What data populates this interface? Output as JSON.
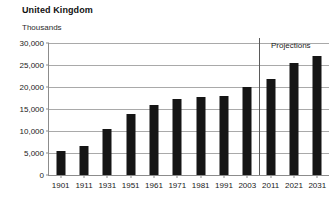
{
  "chart_data": {
    "type": "bar",
    "title": "United Kingdom",
    "subtitle": "Thousands",
    "xlabel": "",
    "ylabel": "Thousands",
    "ylim": [
      0,
      30000
    ],
    "ytick_labels": [
      "30,000",
      "25,000",
      "20,000",
      "15,000",
      "10,000",
      "5,000",
      "0"
    ],
    "ytick_values": [
      30000,
      25000,
      20000,
      15000,
      10000,
      5000,
      0
    ],
    "grid": true,
    "legend": "none",
    "categories": [
      "1901",
      "1911",
      "1931",
      "1951",
      "1961",
      "1971",
      "1981",
      "1991",
      "2003",
      "2011",
      "2021",
      "2031"
    ],
    "values": [
      5500,
      6600,
      10400,
      13800,
      15900,
      17300,
      17800,
      18000,
      19900,
      21900,
      25400,
      27100
    ],
    "annotations": [
      {
        "text": "Projections",
        "after_category": "2003",
        "note": "vertical divider separating historical estimates from projected values"
      }
    ],
    "bar_color": "#151515"
  }
}
